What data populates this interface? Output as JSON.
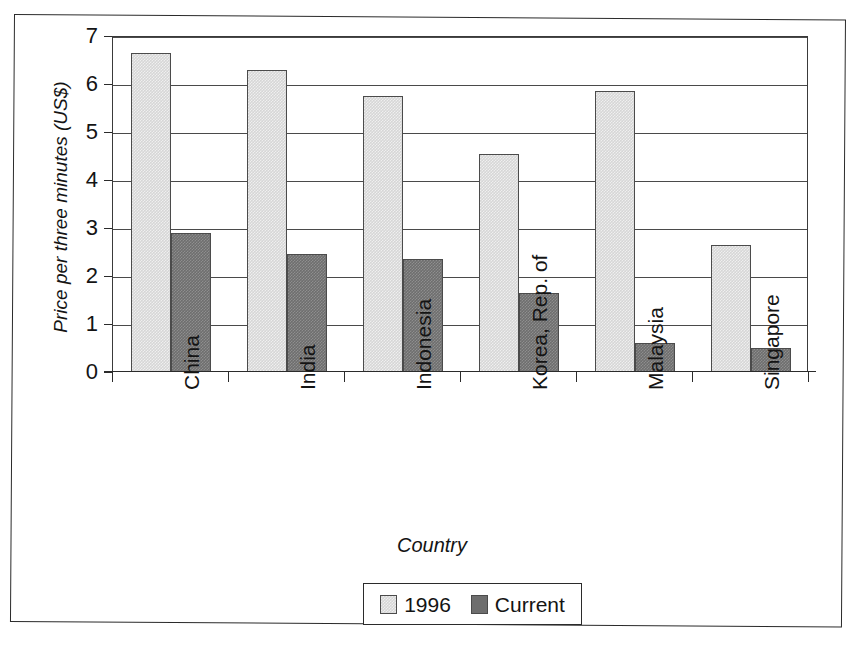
{
  "chart_data": {
    "type": "bar",
    "title": "",
    "xlabel": "Country",
    "ylabel": "Price per three minutes (US$)",
    "categories": [
      "China",
      "India",
      "Indonesia",
      "Korea, Rep. of",
      "Malaysia",
      "Singapore"
    ],
    "series": [
      {
        "name": "1996",
        "color": "#d6d6d6",
        "values": [
          6.65,
          6.3,
          5.75,
          4.55,
          5.85,
          2.65
        ]
      },
      {
        "name": "Current",
        "color": "#6e6e6e",
        "values": [
          2.9,
          2.45,
          2.35,
          1.65,
          0.6,
          0.5
        ]
      }
    ],
    "ylim": [
      0,
      7
    ],
    "yticks": [
      0,
      1,
      2,
      3,
      4,
      5,
      6,
      7
    ],
    "ytick_labels": [
      "0",
      "1",
      "2",
      "3",
      "4",
      "5",
      "6",
      "7"
    ],
    "grid": true,
    "grid_axis": "y",
    "legend_position": "bottom-center",
    "legend_entries": [
      "1996",
      "Current"
    ],
    "xtick_label_rotation": -90
  }
}
